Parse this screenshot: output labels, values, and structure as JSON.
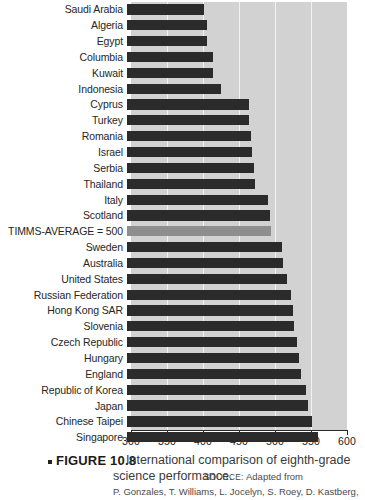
{
  "chart_data": {
    "type": "bar",
    "orientation": "horizontal",
    "title": "International comparison of eighth-grade science performance.",
    "xlabel": "",
    "ylabel": "",
    "xlim": [
      300,
      600
    ],
    "xticks": [
      300,
      350,
      400,
      450,
      500,
      550,
      600
    ],
    "xtick_labels": [
      "300",
      "350",
      "400",
      "450",
      "500",
      "550",
      "600"
    ],
    "grid": true,
    "legend": "none",
    "highlight_category": "TIMMS-AVERAGE = 500",
    "colors": {
      "bar": "#2b2b2b",
      "average_bar": "#8e8e8e",
      "plot_background": "#d2d2d2",
      "gridline": "#f2f2f2"
    },
    "categories": [
      "Saudi Arabia",
      "Algeria",
      "Egypt",
      "Columbia",
      "Kuwait",
      "Indonesia",
      "Cyprus",
      "Turkey",
      "Romania",
      "Israel",
      "Serbia",
      "Thailand",
      "Italy",
      "Scotland",
      "TIMMS-AVERAGE = 500",
      "Sweden",
      "Australia",
      "United States",
      "Russian Federation",
      "Hong Kong SAR",
      "Slovenia",
      "Czech Republic",
      "Hungary",
      "England",
      "Republic of Korea",
      "Japan",
      "Chinese Taipei",
      "Singapore"
    ],
    "values": [
      407,
      411,
      411,
      420,
      420,
      430,
      469,
      469,
      472,
      474,
      476,
      478,
      496,
      498,
      500,
      515,
      516,
      522,
      528,
      530,
      532,
      536,
      539,
      542,
      549,
      551,
      557,
      565
    ]
  },
  "caption": {
    "bullet": "square-bullet",
    "figure_label": "FIGURE 10.8",
    "line1": "International comparison of eighth-grade",
    "line2": "science performance.",
    "source_label": "SOURCE:",
    "source_text_1": "Adapted from",
    "source_text_2": "P. Gonzales, T. Williams, L. Jocelyn, S. Roey, D. Kastberg,"
  }
}
